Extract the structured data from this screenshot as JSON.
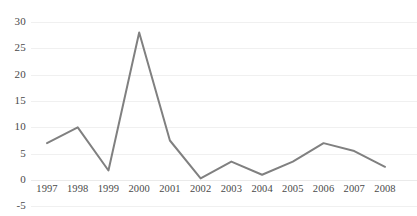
{
  "chart_data": {
    "type": "line",
    "title": "",
    "subtitle": "",
    "xlabel": "",
    "ylabel": "",
    "categories": [
      "1997",
      "1998",
      "1999",
      "2000",
      "2001",
      "2002",
      "2003",
      "2004",
      "2005",
      "2006",
      "2007",
      "2008"
    ],
    "values": [
      7,
      10,
      1.8,
      28,
      7.5,
      0.3,
      3.5,
      1,
      3.5,
      7,
      5.5,
      2.5
    ],
    "series": [
      {
        "name": "series-1",
        "values": [
          7,
          10,
          1.8,
          28,
          7.5,
          0.3,
          3.5,
          1,
          3.5,
          7,
          5.5,
          2.5
        ],
        "color": "#808080"
      }
    ],
    "ylim": [
      -5,
      30
    ],
    "yticks": [
      30,
      25,
      20,
      15,
      10,
      5,
      0,
      -5
    ],
    "ytick_labels": [
      "30",
      "25",
      "20",
      "15",
      "10",
      "5",
      "0",
      "-5"
    ],
    "xtick_labels": [
      "1997",
      "1998",
      "1999",
      "2000",
      "2001",
      "2002",
      "2003",
      "2004",
      "2005",
      "2006",
      "2007",
      "2008"
    ],
    "grid": true,
    "grid_color": "#f0f0f0",
    "legend": false,
    "legend_position": "none",
    "background_color": "#ffffff",
    "line_color": "#808080",
    "line_width": 2,
    "markers": false,
    "annotations": []
  }
}
